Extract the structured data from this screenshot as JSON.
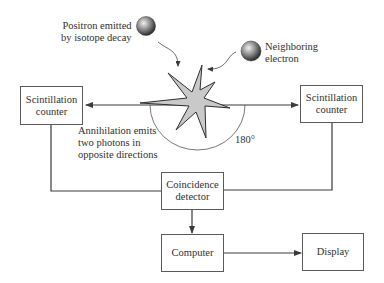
{
  "diagram": {
    "title": "",
    "labels": {
      "positron": "Positron emitted\nby isotope decay",
      "positron_line1": "Positron emitted",
      "positron_line2": "by isotope decay",
      "electron_line1": "Neighboring",
      "electron_line2": "electron",
      "annihilation_line1": "Annihilation emits",
      "annihilation_line2": "two photons in",
      "annihilation_line3": "opposite directions",
      "angle": "180°"
    },
    "boxes": {
      "scint_left": "Scintillation\ncounter",
      "scint_right": "Scintillation\ncounter",
      "coincidence": "Coincidence\ndetector",
      "computer": "Computer",
      "display": "Display"
    },
    "colors": {
      "line": "#4a4a4a",
      "box_border": "#5a5a5a",
      "starburst_fill": "#c8c8c8",
      "starburst_stroke": "#333333",
      "sphere_light": "#e6e6e6",
      "sphere_dark": "#3a3a3a"
    },
    "connections": [
      {
        "from": "annihilation",
        "to": "scint_left",
        "label": "photon"
      },
      {
        "from": "annihilation",
        "to": "scint_right",
        "label": "photon"
      },
      {
        "from": "scint_left",
        "to": "coincidence"
      },
      {
        "from": "scint_right",
        "to": "coincidence"
      },
      {
        "from": "coincidence",
        "to": "computer"
      },
      {
        "from": "computer",
        "to": "display"
      }
    ]
  }
}
